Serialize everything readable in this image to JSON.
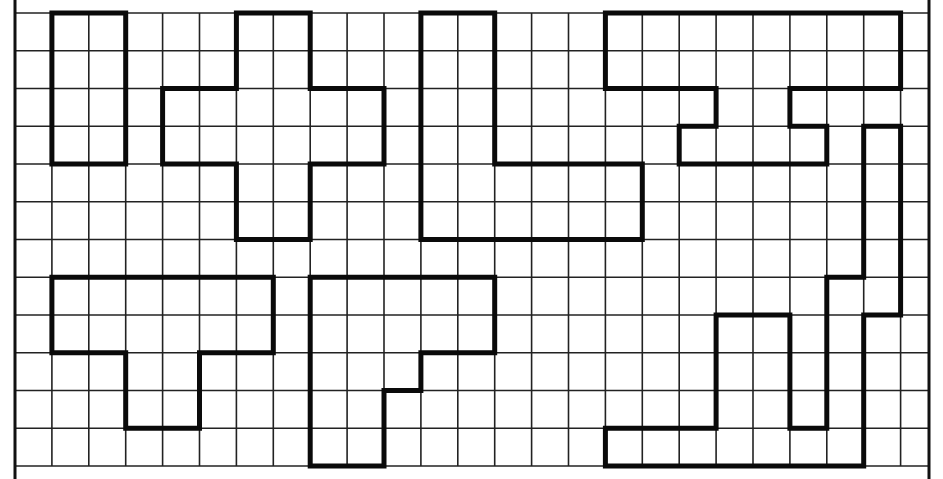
{
  "worksheet": {
    "grid": {
      "origin_x": 15,
      "origin_y": 13,
      "cell_w": 36.9,
      "cell_h": 37.75,
      "cols": 24,
      "rows": 12,
      "extra_right_px": 28,
      "border_left_x": 15,
      "border_right_x": 929,
      "frame_top_y": 0,
      "frame_bottom_y": 479,
      "line_color": "#222222",
      "border_color": "#111111",
      "shape_color": "#0a0a0a"
    },
    "shapes": [
      {
        "id": "rectangle-2x4",
        "points": [
          [
            1,
            0
          ],
          [
            3,
            0
          ],
          [
            3,
            4
          ],
          [
            1,
            4
          ]
        ]
      },
      {
        "id": "cross",
        "points": [
          [
            6,
            0
          ],
          [
            8,
            0
          ],
          [
            8,
            2
          ],
          [
            10,
            2
          ],
          [
            10,
            4
          ],
          [
            8,
            4
          ],
          [
            8,
            6
          ],
          [
            6,
            6
          ],
          [
            6,
            4
          ],
          [
            4,
            4
          ],
          [
            4,
            2
          ],
          [
            6,
            2
          ]
        ]
      },
      {
        "id": "l-shape",
        "points": [
          [
            11,
            0
          ],
          [
            13,
            0
          ],
          [
            13,
            4
          ],
          [
            17,
            4
          ],
          [
            17,
            6
          ],
          [
            11,
            6
          ]
        ]
      },
      {
        "id": "top-right-bar-with-notch",
        "points": [
          [
            16,
            0
          ],
          [
            24,
            0
          ],
          [
            24,
            2
          ],
          [
            21,
            2
          ],
          [
            21,
            3
          ],
          [
            22,
            3
          ],
          [
            22,
            4
          ],
          [
            18,
            4
          ],
          [
            18,
            3
          ],
          [
            19,
            3
          ],
          [
            19,
            2
          ],
          [
            16,
            2
          ]
        ]
      },
      {
        "id": "t-shape",
        "points": [
          [
            1,
            7
          ],
          [
            7,
            7
          ],
          [
            7,
            9
          ],
          [
            5,
            9
          ],
          [
            5,
            11
          ],
          [
            3,
            11
          ],
          [
            3,
            9
          ],
          [
            1,
            9
          ]
        ]
      },
      {
        "id": "stepped-shape",
        "points": [
          [
            8,
            7
          ],
          [
            13,
            7
          ],
          [
            13,
            9
          ],
          [
            11,
            9
          ],
          [
            11,
            10
          ],
          [
            10,
            10
          ],
          [
            10,
            12
          ],
          [
            8,
            12
          ]
        ]
      },
      {
        "id": "snake-shape",
        "points": [
          [
            16,
            11
          ],
          [
            19,
            11
          ],
          [
            19,
            8
          ],
          [
            21,
            8
          ],
          [
            21,
            11
          ],
          [
            22,
            11
          ],
          [
            22,
            7
          ],
          [
            23,
            7
          ],
          [
            23,
            3
          ],
          [
            24,
            3
          ],
          [
            24,
            8
          ],
          [
            23,
            8
          ],
          [
            23,
            12
          ],
          [
            16,
            12
          ]
        ]
      }
    ]
  }
}
